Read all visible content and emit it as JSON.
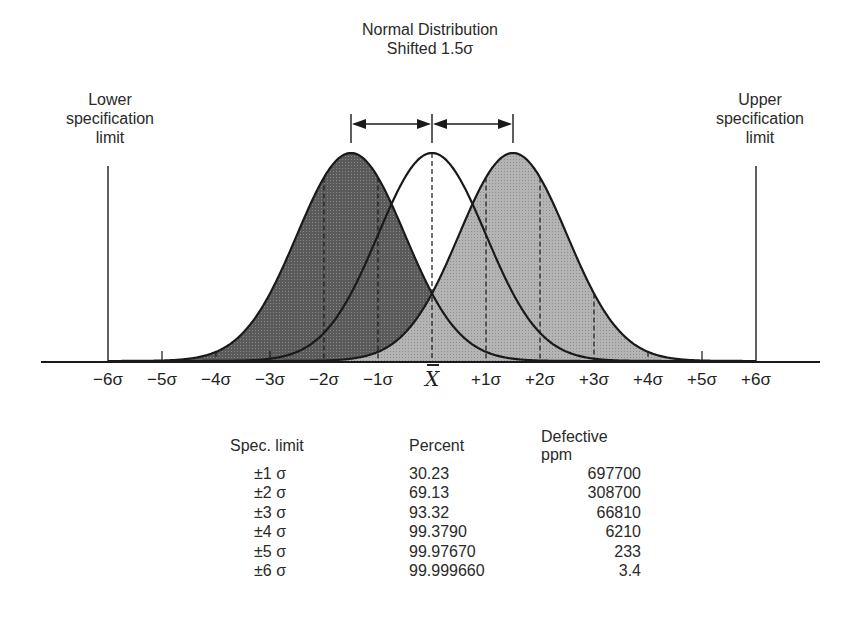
{
  "chart_data": {
    "type": "area",
    "title": "Normal Distribution Shifted 1.5σ",
    "title_lines": [
      "Normal Distribution",
      "Shifted 1.5σ"
    ],
    "xlabel": "",
    "ylabel": "",
    "x_tick_labels": [
      "−6σ",
      "−5σ",
      "−4σ",
      "−3σ",
      "−2σ",
      "−1σ",
      "X̄",
      "+1σ",
      "+2σ",
      "+3σ",
      "+4σ",
      "+5σ",
      "+6σ"
    ],
    "x_ticks": [
      -6,
      -5,
      -4,
      -3,
      -2,
      -1,
      0,
      1,
      2,
      3,
      4,
      5,
      6
    ],
    "xlim": [
      -6.9,
      7.2
    ],
    "series": [
      {
        "name": "Centered distribution",
        "mean": 0,
        "sd": 1,
        "fill": "none"
      },
      {
        "name": "Shifted −1.5σ",
        "mean": -1.5,
        "sd": 1,
        "fill": "#5a5a5a"
      },
      {
        "name": "Shifted +1.5σ",
        "mean": 1.5,
        "sd": 1,
        "fill": "#b4b4b4"
      }
    ],
    "shift_sigma": 1.5,
    "annotations": [
      {
        "text_lines": [
          "Lower",
          "specification",
          "limit"
        ],
        "x": -6
      },
      {
        "text_lines": [
          "Upper",
          "specification",
          "limit"
        ],
        "x": 6
      },
      {
        "type": "double-arrow",
        "from": -1.5,
        "to": 0
      },
      {
        "type": "double-arrow",
        "from": 0,
        "to": 1.5
      }
    ],
    "table": {
      "columns": [
        "Spec. limit",
        "Percent",
        "Defective ppm"
      ],
      "rows": [
        [
          "±1 σ",
          "30.23",
          "697700"
        ],
        [
          "±2 σ",
          "69.13",
          "308700"
        ],
        [
          "±3 σ",
          "93.32",
          "66810"
        ],
        [
          "±4 σ",
          "99.3790",
          "6210"
        ],
        [
          "±5 σ",
          "99.97670",
          "233"
        ],
        [
          "±6 σ",
          "99.999660",
          "3.4"
        ]
      ]
    },
    "grid": false,
    "legend": "none"
  },
  "labels": {
    "title_line1": "Normal Distribution",
    "title_line2": "Shifted 1.5σ",
    "lower_line1": "Lower",
    "lower_line2": "specification",
    "lower_line3": "limit",
    "upper_line1": "Upper",
    "upper_line2": "specification",
    "upper_line3": "limit",
    "xbar": "X"
  },
  "colors": {
    "dark_fill": "#5a5a5a",
    "light_fill": "#b4b4b4",
    "stroke": "#1a1a1a"
  }
}
